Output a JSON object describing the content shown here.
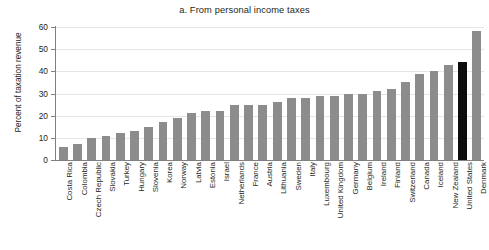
{
  "chart_data": {
    "type": "bar",
    "title": "a. From personal income taxes",
    "xlabel": "",
    "ylabel": "Percent of taxation revenue",
    "ylim": [
      0,
      60
    ],
    "yticks": [
      0,
      10,
      20,
      30,
      40,
      50,
      60
    ],
    "grid": true,
    "legend": "none",
    "highlight_category": "United States",
    "colors": {
      "bar": "#8c8c8c",
      "highlight_bar": "#0d0d0d",
      "gridline": "#e6e6e6",
      "axis": "#808080",
      "text": "#231f20"
    },
    "categories": [
      "Costa Rica",
      "Colombia",
      "Czech Republic",
      "Slovakia",
      "Turkey",
      "Hungary",
      "Slovenia",
      "Korea",
      "Norway",
      "Latvia",
      "Estonia",
      "Israel",
      "Netherlands",
      "France",
      "Austria",
      "Lithuania",
      "Sweden",
      "Italy",
      "Luxembourg",
      "United Kingdom",
      "Germany",
      "Belgium",
      "Ireland",
      "Finland",
      "Switzerland",
      "Canada",
      "Iceland",
      "New Zealand",
      "United States",
      "Denmark"
    ],
    "values": [
      6,
      7,
      10,
      11,
      12,
      13,
      15,
      17,
      19,
      21,
      22,
      22,
      25,
      25,
      25,
      26,
      28,
      28,
      29,
      29,
      30,
      30,
      31,
      32,
      35,
      39,
      40,
      43,
      44,
      58
    ]
  }
}
